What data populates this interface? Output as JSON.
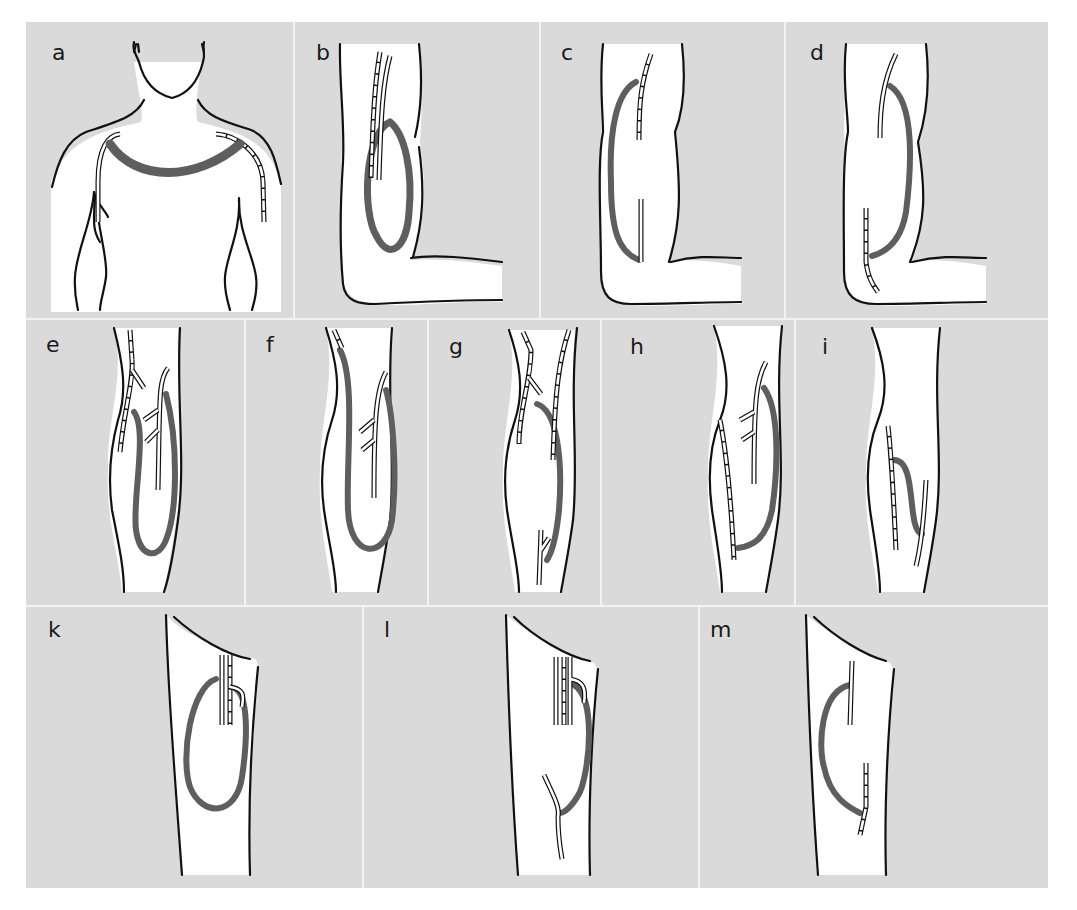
{
  "figure": {
    "background_color": "#dadada",
    "graft_color": "#5e5e5e",
    "outline_color": "#111111",
    "panels": [
      {
        "id": "a",
        "label": "a",
        "region": "chest / shoulders"
      },
      {
        "id": "b",
        "label": "b",
        "region": "upper arm"
      },
      {
        "id": "c",
        "label": "c",
        "region": "upper arm"
      },
      {
        "id": "d",
        "label": "d",
        "region": "upper arm"
      },
      {
        "id": "e",
        "label": "e",
        "region": "forearm"
      },
      {
        "id": "f",
        "label": "f",
        "region": "forearm"
      },
      {
        "id": "g",
        "label": "g",
        "region": "forearm"
      },
      {
        "id": "h",
        "label": "h",
        "region": "forearm"
      },
      {
        "id": "i",
        "label": "i",
        "region": "forearm"
      },
      {
        "id": "k",
        "label": "k",
        "region": "thigh"
      },
      {
        "id": "l",
        "label": "l",
        "region": "thigh"
      },
      {
        "id": "m",
        "label": "m",
        "region": "thigh"
      }
    ]
  }
}
